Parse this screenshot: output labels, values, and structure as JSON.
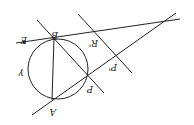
{
  "diagram": {
    "orientation": "rotated 180 degrees",
    "circle": {
      "label": "γ",
      "cx": 58,
      "cy": 69,
      "r": 30
    },
    "points": [
      {
        "id": "E",
        "label": "E",
        "x": 24,
        "y": 42
      },
      {
        "id": "B",
        "label": "B",
        "x": 54,
        "y": 38
      },
      {
        "id": "A",
        "label": "A",
        "x": 52,
        "y": 100
      },
      {
        "id": "P",
        "label": "P",
        "x": 88,
        "y": 76
      },
      {
        "id": "R1",
        "label": "R'",
        "x": 93,
        "y": 31
      },
      {
        "id": "P1",
        "label": "P'",
        "x": 116,
        "y": 55
      }
    ],
    "lines": [
      {
        "id": "line-EB",
        "x1": 16,
        "y1": 43,
        "x2": 180,
        "y2": 19
      },
      {
        "id": "line-BP",
        "x1": 37,
        "y1": 20,
        "x2": 104,
        "y2": 93
      },
      {
        "id": "line-AP",
        "x1": 32,
        "y1": 115,
        "x2": 176,
        "y2": 13
      },
      {
        "id": "line-RP",
        "x1": 78,
        "y1": 14,
        "x2": 132,
        "y2": 73
      },
      {
        "id": "chord-AB",
        "x1": 54,
        "y1": 38,
        "x2": 52,
        "y2": 100
      }
    ],
    "labels": {
      "E": "E",
      "B": "B",
      "A": "A",
      "P": "P",
      "R1": "R'",
      "P1": "P'",
      "gamma": "γ"
    },
    "stroke_color": "#222222"
  }
}
